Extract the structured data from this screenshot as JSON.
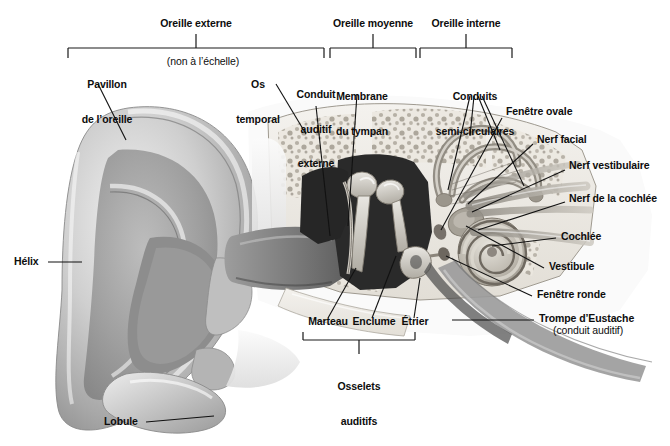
{
  "figure": {
    "title_region": "Anatomie de l'oreille",
    "background_color": "#ffffff",
    "text_color": "#0d0d0d",
    "line_color": "#1a1a1a"
  },
  "top_brackets": [
    {
      "label": "Oreille externe",
      "x1": 68,
      "x2": 324,
      "label_x": 196,
      "label_y": 22
    },
    {
      "label": "Oreille moyenne",
      "x1": 330,
      "x2": 416,
      "label_x": 373,
      "label_y": 22
    },
    {
      "label": "Oreille interne",
      "x1": 420,
      "x2": 512,
      "label_x": 466,
      "label_y": 22
    }
  ],
  "bottom_bracket": {
    "label_line1": "Osselets",
    "label_line2": "auditifs",
    "x1": 303,
    "x2": 415,
    "label_x": 359,
    "label_y": 362
  },
  "top_labels": [
    {
      "name": "pavillon-de-loreille",
      "line1": "Pavillon",
      "line2": "de l’oreille",
      "x": 72,
      "y": 58
    },
    {
      "name": "non-a-lechelle",
      "line1": "(non à l’échelle)",
      "line2": "",
      "x": 155,
      "y": 58,
      "style": "sub"
    },
    {
      "name": "os-temporal",
      "line1": "Os",
      "line2": "temporal",
      "x": 249,
      "y": 58
    },
    {
      "name": "conduit-auditif-externe",
      "line1": "Conduit",
      "line2": "auditif",
      "line3": "externe",
      "x": 294,
      "y": 58
    },
    {
      "name": "membrane-du-tympan",
      "line1": "Membrane",
      "line2": "du tympan",
      "x": 340,
      "y": 70
    },
    {
      "name": "conduits-semi-circulaires",
      "line1": "Conduits",
      "line2": "semi-circulaires",
      "x": 440,
      "y": 70
    }
  ],
  "left_labels": [
    {
      "name": "helix",
      "text": "Hélix",
      "x": 14,
      "y": 258
    },
    {
      "name": "lobule",
      "text": "Lobule",
      "x": 110,
      "y": 418
    }
  ],
  "right_labels": [
    {
      "name": "fenetre-ovale",
      "text": "Fenêtre ovale",
      "x": 505,
      "y": 112
    },
    {
      "name": "nerf-facial",
      "text": "Nerf facial",
      "x": 536,
      "y": 141
    },
    {
      "name": "nerf-vestibulaire",
      "text": "Nerf vestibulaire",
      "x": 568,
      "y": 166
    },
    {
      "name": "nerf-de-la-cochlee",
      "text": "Nerf de la cochlée",
      "x": 568,
      "y": 199
    },
    {
      "name": "cochlee",
      "text": "Cochlée",
      "x": 560,
      "y": 235
    },
    {
      "name": "vestibule",
      "text": "Vestibule",
      "x": 548,
      "y": 265
    },
    {
      "name": "fenetre-ronde",
      "text": "Fenêtre ronde",
      "x": 536,
      "y": 293
    },
    {
      "name": "trompe-deustache",
      "text": "Trompe d’Eustache",
      "x": 538,
      "y": 318
    },
    {
      "name": "conduit-auditif-paren",
      "text": "(conduit auditif)",
      "x": 553,
      "y": 330,
      "style": "sub"
    }
  ],
  "ossicle_labels": [
    {
      "name": "marteau",
      "text": "Marteau",
      "x": 305,
      "y": 322
    },
    {
      "name": "enclume",
      "text": "Enclume",
      "x": 352,
      "y": 322
    },
    {
      "name": "etrier",
      "text": "Étrier",
      "x": 398,
      "y": 322
    }
  ]
}
